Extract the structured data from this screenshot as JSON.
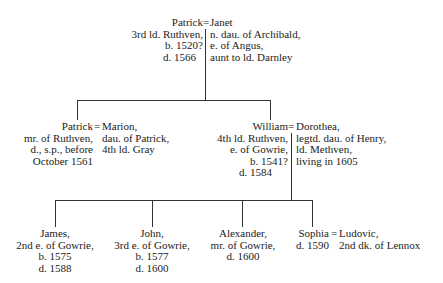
{
  "gen1": {
    "husband": {
      "name": "Patrick",
      "lines": [
        "3rd ld. Ruthven,",
        "b. 1520?",
        "d. 1566"
      ]
    },
    "eq": "=",
    "wife": {
      "name": "Janet",
      "lines": [
        "n. dau. of Archibald,",
        "e. of Angus,",
        "aunt to ld. Darnley"
      ]
    }
  },
  "gen2": [
    {
      "husband": {
        "name": "Patrick",
        "lines": [
          "mr. of Ruthven,",
          "d., s.p., before",
          "October 1561"
        ]
      },
      "eq": "=",
      "wife": {
        "name": "Marion,",
        "lines": [
          "dau. of Patrick,",
          "4th ld. Gray"
        ]
      }
    },
    {
      "husband": {
        "name": "William",
        "lines": [
          "4th ld. Ruthven,",
          "e. of Gowrie,",
          "b. 1541?",
          "d. 1584"
        ]
      },
      "eq": "=",
      "wife": {
        "name": "Dorothea,",
        "lines": [
          "legtd. dau. of Henry,",
          "ld. Methven,",
          "living in 1605"
        ]
      }
    }
  ],
  "gen3": [
    {
      "name": "James,",
      "lines": [
        "2nd e. of Gowrie,",
        "b. 1575",
        "d. 1588"
      ]
    },
    {
      "name": "John,",
      "lines": [
        "3rd e. of Gowrie,",
        "b. 1577",
        "d. 1600"
      ]
    },
    {
      "name": "Alexander,",
      "lines": [
        "mr. of Gowrie,",
        "d. 1600"
      ]
    },
    {
      "name": "Sophia",
      "lines": [
        "d. 1590"
      ],
      "eq": "=",
      "spouse": {
        "name": "Ludovic,",
        "lines": [
          "2nd dk. of Lennox"
        ]
      }
    }
  ]
}
